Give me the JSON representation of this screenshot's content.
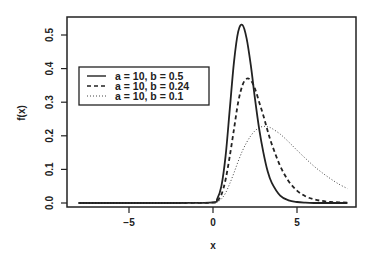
{
  "chart_data": {
    "type": "line",
    "title": "",
    "xlabel": "x",
    "ylabel": "f(x)",
    "xlim": [
      -8,
      8
    ],
    "ylim": [
      0,
      0.53
    ],
    "x_ticks": [
      "-5",
      "0",
      "5"
    ],
    "y_ticks": [
      "0.0",
      "0.1",
      "0.2",
      "0.3",
      "0.4",
      "0.5"
    ],
    "grid": false,
    "legend_position": "upper left",
    "x": [
      -8,
      -6,
      -4,
      -2,
      0,
      0.25,
      0.5,
      0.75,
      1,
      1.25,
      1.5,
      1.75,
      2,
      2.25,
      2.5,
      2.75,
      3,
      3.25,
      3.5,
      4,
      4.5,
      5,
      5.5,
      6,
      6.5,
      7,
      7.5,
      8
    ],
    "series": [
      {
        "name": "a = 10, b = 0.5",
        "style": "solid",
        "values": [
          0,
          0,
          0,
          0,
          0.002,
          0.012,
          0.05,
          0.14,
          0.28,
          0.42,
          0.51,
          0.53,
          0.49,
          0.41,
          0.31,
          0.22,
          0.15,
          0.095,
          0.06,
          0.022,
          0.008,
          0.003,
          0.001,
          0,
          0,
          0,
          0,
          0
        ]
      },
      {
        "name": "a = 10, b = 0.24",
        "style": "dashed",
        "values": [
          0,
          0,
          0,
          0,
          0.001,
          0.006,
          0.025,
          0.07,
          0.14,
          0.22,
          0.3,
          0.35,
          0.37,
          0.365,
          0.34,
          0.3,
          0.26,
          0.215,
          0.175,
          0.11,
          0.065,
          0.037,
          0.02,
          0.011,
          0.006,
          0.003,
          0.002,
          0.001
        ]
      },
      {
        "name": "a = 10, b = 0.1",
        "style": "dotted",
        "values": [
          0,
          0,
          0,
          0,
          0.0005,
          0.003,
          0.012,
          0.03,
          0.058,
          0.09,
          0.124,
          0.155,
          0.18,
          0.2,
          0.215,
          0.224,
          0.228,
          0.227,
          0.222,
          0.205,
          0.182,
          0.157,
          0.133,
          0.11,
          0.09,
          0.072,
          0.056,
          0.043
        ]
      }
    ]
  },
  "plot": {
    "xlabel": "x",
    "ylabel": "f(x)",
    "x_ticks": [
      {
        "value": -5,
        "label": "−5"
      },
      {
        "value": 0,
        "label": "0"
      },
      {
        "value": 5,
        "label": "5"
      }
    ],
    "y_ticks": [
      {
        "value": 0.0,
        "label": "0.0"
      },
      {
        "value": 0.1,
        "label": "0.1"
      },
      {
        "value": 0.2,
        "label": "0.2"
      },
      {
        "value": 0.3,
        "label": "0.3"
      },
      {
        "value": 0.4,
        "label": "0.4"
      },
      {
        "value": 0.5,
        "label": "0.5"
      }
    ],
    "legend": [
      {
        "label": "a = 10, b = 0.5",
        "style": "solid"
      },
      {
        "label": "a = 10, b = 0.24",
        "style": "dashed"
      },
      {
        "label": "a = 10, b = 0.1",
        "style": "dotted"
      }
    ],
    "line_color": "#222222",
    "box_color": "#222222"
  }
}
